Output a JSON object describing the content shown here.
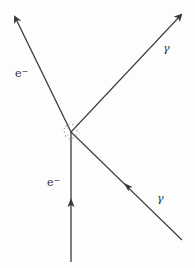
{
  "diagram": {
    "type": "compton-scattering-particle-tracks",
    "colors": {
      "line": "#3a3a3a",
      "background": "#fdfdfd",
      "burst": "#8a8a8a"
    },
    "collision_point": {
      "x": 71,
      "y": 132
    },
    "tracks": [
      {
        "id": "incoming-electron",
        "label": "e",
        "charge": "−",
        "from": {
          "x": 71,
          "y": 262
        },
        "to": {
          "x": 71,
          "y": 132
        },
        "arrow_at": {
          "x": 71,
          "y": 203
        },
        "arrow_dir": "up"
      },
      {
        "id": "incoming-photon",
        "label": "γ",
        "from": {
          "x": 182,
          "y": 240
        },
        "to": {
          "x": 71,
          "y": 132
        },
        "arrow_at": {
          "x": 127,
          "y": 186
        },
        "arrow_dir": "up-left"
      },
      {
        "id": "outgoing-electron",
        "label": "e",
        "charge": "−",
        "from": {
          "x": 71,
          "y": 132
        },
        "to": {
          "x": 14,
          "y": 15
        },
        "arrow_at": {
          "x": 14,
          "y": 15
        },
        "arrow_dir": "up-left"
      },
      {
        "id": "outgoing-photon",
        "label": "γ",
        "from": {
          "x": 71,
          "y": 132
        },
        "to": {
          "x": 182,
          "y": 14
        },
        "arrow_at": {
          "x": 182,
          "y": 14
        },
        "arrow_dir": "up-right"
      }
    ],
    "labels": {
      "outgoing_electron": {
        "text": "e",
        "sup": "−"
      },
      "outgoing_photon": {
        "text": "γ"
      },
      "incoming_electron": {
        "text": "e",
        "sup": "−"
      },
      "incoming_photon": {
        "text": "γ"
      }
    }
  }
}
